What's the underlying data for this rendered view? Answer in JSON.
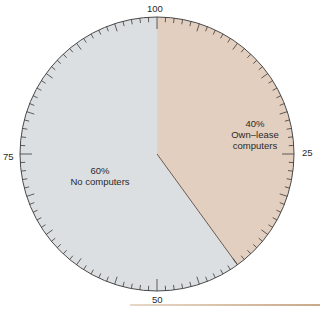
{
  "chart_data": {
    "type": "pie",
    "title": "",
    "slices": [
      {
        "label": "Own-lease computers",
        "value": 40,
        "display": "40%",
        "color": "#e3cfbf"
      },
      {
        "label": "No computers",
        "value": 60,
        "display": "60%",
        "color": "#dcdfe2"
      }
    ],
    "start_angle": "top (12 o'clock)",
    "direction": "clockwise",
    "scale": {
      "min": 0,
      "max": 100,
      "minor_tick": 1,
      "major_tick": 5,
      "tick_labels": [
        "100",
        "25",
        "50",
        "75"
      ]
    }
  },
  "labels": {
    "own": {
      "pct": "40%",
      "line1": "Own–lease",
      "line2": "computers"
    },
    "none": {
      "pct": "60%",
      "line1": "No computers"
    },
    "ticks": {
      "top": "100",
      "right": "25",
      "bottom": "50",
      "left": "75"
    }
  }
}
